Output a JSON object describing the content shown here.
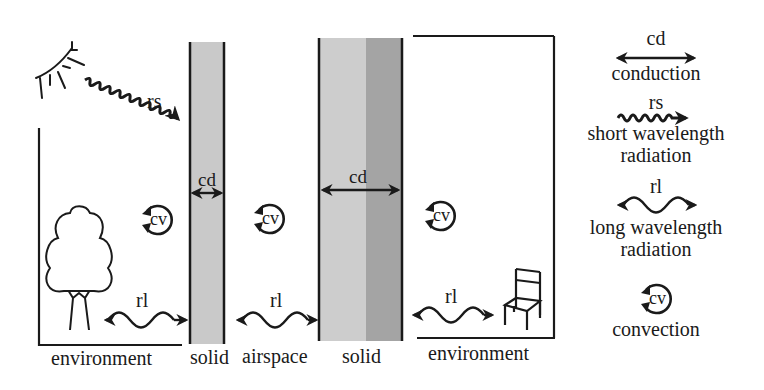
{
  "diagram": {
    "colors": {
      "stroke": "#1a1a1a",
      "solid_light": "#cfcfcf",
      "solid_mid": "#c4c4c4",
      "solid_dark": "#a3a3a3",
      "background": "#ffffff"
    },
    "zones": [
      {
        "id": "env-left",
        "label": "environment"
      },
      {
        "id": "solid-1",
        "label": "solid"
      },
      {
        "id": "airspace",
        "label": "airspace"
      },
      {
        "id": "solid-2",
        "label": "solid"
      },
      {
        "id": "env-right",
        "label": "environment"
      }
    ],
    "annotations": {
      "rs": "rs",
      "cd_thin": "cd",
      "cd_thick": "cd",
      "cv_left": "cv",
      "cv_mid": "cv",
      "cv_right": "cv",
      "rl_left": "rl",
      "rl_mid": "rl",
      "rl_right": "rl"
    },
    "icons": {
      "sun": "sun-icon",
      "tree": "tree-icon",
      "chair": "chair-icon"
    }
  },
  "legend": {
    "items": [
      {
        "symbol": "cd",
        "icon": "double-arrow-icon",
        "label_lines": [
          "conduction"
        ]
      },
      {
        "symbol": "rs",
        "icon": "short-wave-arrow-icon",
        "label_lines": [
          "short wavelength",
          "radiation"
        ]
      },
      {
        "symbol": "rl",
        "icon": "long-wave-arrow-icon",
        "label_lines": [
          "long wavelength",
          "radiation"
        ]
      },
      {
        "symbol": "cv",
        "icon": "convection-loop-icon",
        "label_lines": [
          "convection"
        ]
      }
    ]
  }
}
